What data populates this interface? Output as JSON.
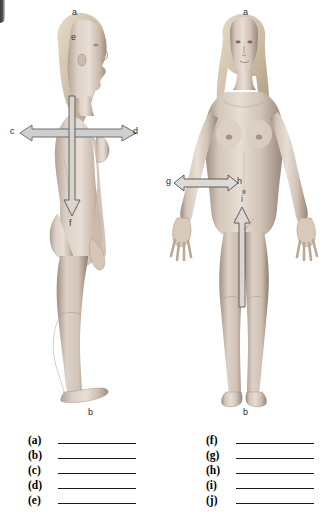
{
  "page": {
    "background_color": "#ffffff",
    "width": 335,
    "height": 524
  },
  "figures": [
    {
      "name": "lateral-view-figure",
      "view": "lateral",
      "description": "female human body, side view, standing anatomical position",
      "labels": [
        {
          "id": "a",
          "text": "a",
          "x": 72,
          "y": 8,
          "placement": "above-head"
        },
        {
          "id": "e",
          "text": "e",
          "x": 71,
          "y": 33,
          "placement": "on-head-crown"
        },
        {
          "id": "c",
          "text": "c",
          "x": 10,
          "y": 127,
          "placement": "left-of-horizontal-arrow"
        },
        {
          "id": "d",
          "text": "d",
          "x": 133,
          "y": 127,
          "placement": "right-of-horizontal-arrow"
        },
        {
          "id": "f",
          "text": "f",
          "x": 69,
          "y": 219,
          "placement": "below-vertical-arrow"
        },
        {
          "id": "b",
          "text": "b",
          "x": 88,
          "y": 408,
          "placement": "below-foot"
        }
      ],
      "arrows": [
        {
          "name": "horizontal-double-arrow-cd",
          "orientation": "horizontal",
          "heads": "both",
          "x1": 20,
          "x2": 132,
          "y": 132
        },
        {
          "name": "vertical-down-arrow-f",
          "orientation": "vertical",
          "heads": "down",
          "x": 70,
          "y1": 100,
          "y2": 214
        }
      ]
    },
    {
      "name": "anterior-view-figure",
      "view": "anterior",
      "description": "female human body, front view, standing anatomical position",
      "labels": [
        {
          "id": "a",
          "text": "a",
          "x": 243,
          "y": 8,
          "placement": "above-head"
        },
        {
          "id": "g",
          "text": "g",
          "x": 168,
          "y": 177,
          "placement": "left-of-horizontal-arrow"
        },
        {
          "id": "h",
          "text": "h",
          "x": 237,
          "y": 177,
          "placement": "right-of-horizontal-arrow"
        },
        {
          "id": "i",
          "text": "i",
          "x": 241,
          "y": 196,
          "placement": "above-vertical-arrow"
        },
        {
          "id": "b",
          "text": "b",
          "x": 243,
          "y": 408,
          "placement": "below-feet"
        }
      ],
      "arrows": [
        {
          "name": "horizontal-double-arrow-gh",
          "orientation": "horizontal",
          "heads": "both",
          "x1": 176,
          "x2": 236,
          "y": 182
        },
        {
          "name": "vertical-up-arrow-i",
          "orientation": "vertical",
          "heads": "up",
          "x": 240,
          "y1": 300,
          "y2": 211
        }
      ]
    }
  ],
  "answer_blanks": {
    "name": "answer-blank-list",
    "left_column": [
      {
        "key": "(a)",
        "value": ""
      },
      {
        "key": "(b)",
        "value": ""
      },
      {
        "key": "(c)",
        "value": ""
      },
      {
        "key": "(d)",
        "value": ""
      },
      {
        "key": "(e)",
        "value": ""
      }
    ],
    "right_column": [
      {
        "key": "(f)",
        "value": ""
      },
      {
        "key": "(g)",
        "value": ""
      },
      {
        "key": "(h)",
        "value": ""
      },
      {
        "key": "(i)",
        "value": ""
      },
      {
        "key": "(j)",
        "value": ""
      }
    ]
  },
  "colors": {
    "label_text": "#2b2b2b",
    "answer_key_text": "#000000",
    "answer_line": "#1a1a1a",
    "arrow_fill": "#c9c9c9",
    "arrow_stroke": "#6e6e6e",
    "skin_light": "#e3d8cf",
    "skin_mid": "#c2b2a6",
    "skin_shadow": "#948477",
    "hair_light": "#ded3c2",
    "hair_mid": "#b9ab96"
  }
}
